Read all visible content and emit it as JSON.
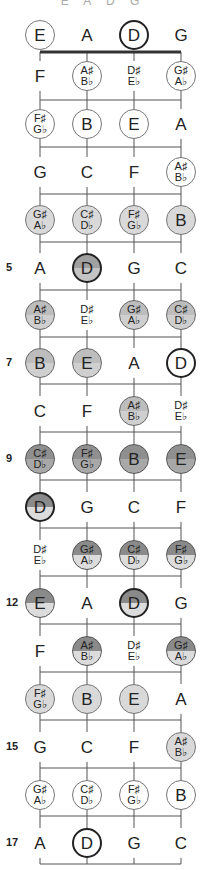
{
  "header": {
    "partial_text": "E A D G"
  },
  "strings": [
    "E",
    "A",
    "D",
    "G"
  ],
  "string_x": [
    40,
    87,
    134,
    181
  ],
  "fret_lines_y": [
    52,
    100,
    147,
    194,
    242,
    290,
    337,
    384,
    432,
    480,
    528,
    576,
    624,
    672,
    720,
    768,
    816,
    864
  ],
  "rows": [
    {
      "fret": "",
      "y": 35,
      "notes": [
        {
          "label": [
            "E"
          ],
          "style": "white"
        },
        {
          "label": [
            "A"
          ],
          "style": "plain"
        },
        {
          "label": [
            "D"
          ],
          "style": "root"
        },
        {
          "label": [
            "G"
          ],
          "style": "plain"
        }
      ]
    },
    {
      "fret": "",
      "y": 76,
      "notes": [
        {
          "label": [
            "F"
          ],
          "style": "plain"
        },
        {
          "label": [
            "A♯",
            "B♭"
          ],
          "style": "white"
        },
        {
          "label": [
            "D♯",
            "E♭"
          ],
          "style": "plain"
        },
        {
          "label": [
            "G♯",
            "A♭"
          ],
          "style": "white"
        }
      ]
    },
    {
      "fret": "",
      "y": 124,
      "notes": [
        {
          "label": [
            "F♯",
            "G♭"
          ],
          "style": "white"
        },
        {
          "label": [
            "B"
          ],
          "style": "white"
        },
        {
          "label": [
            "E"
          ],
          "style": "white"
        },
        {
          "label": [
            "A"
          ],
          "style": "plain"
        }
      ]
    },
    {
      "fret": "",
      "y": 172,
      "notes": [
        {
          "label": [
            "G"
          ],
          "style": "plain"
        },
        {
          "label": [
            "C"
          ],
          "style": "plain"
        },
        {
          "label": [
            "F"
          ],
          "style": "plain"
        },
        {
          "label": [
            "A♯",
            "B♭"
          ],
          "style": "white"
        }
      ]
    },
    {
      "fret": "",
      "y": 220,
      "notes": [
        {
          "label": [
            "G♯",
            "A♭"
          ],
          "style": "light"
        },
        {
          "label": [
            "C♯",
            "D♭"
          ],
          "style": "light"
        },
        {
          "label": [
            "F♯",
            "G♭"
          ],
          "style": "light"
        },
        {
          "label": [
            "B"
          ],
          "style": "light"
        }
      ]
    },
    {
      "fret": "5",
      "y": 268,
      "notes": [
        {
          "label": [
            "A"
          ],
          "style": "plain"
        },
        {
          "label": [
            "D"
          ],
          "style": "rootdark"
        },
        {
          "label": [
            "G"
          ],
          "style": "plain"
        },
        {
          "label": [
            "C"
          ],
          "style": "plain"
        }
      ]
    },
    {
      "fret": "",
      "y": 315,
      "notes": [
        {
          "label": [
            "A♯",
            "B♭"
          ],
          "style": "mid"
        },
        {
          "label": [
            "D♯",
            "E♭"
          ],
          "style": "plain"
        },
        {
          "label": [
            "G♯",
            "A♭"
          ],
          "style": "mid"
        },
        {
          "label": [
            "C♯",
            "D♭"
          ],
          "style": "mid"
        }
      ]
    },
    {
      "fret": "7",
      "y": 363,
      "notes": [
        {
          "label": [
            "B"
          ],
          "style": "mid"
        },
        {
          "label": [
            "E"
          ],
          "style": "mid"
        },
        {
          "label": [
            "A"
          ],
          "style": "plain"
        },
        {
          "label": [
            "D"
          ],
          "style": "root"
        }
      ]
    },
    {
      "fret": "",
      "y": 411,
      "notes": [
        {
          "label": [
            "C"
          ],
          "style": "plain"
        },
        {
          "label": [
            "F"
          ],
          "style": "plain"
        },
        {
          "label": [
            "A♯",
            "B♭"
          ],
          "style": "mid"
        },
        {
          "label": [
            "D♯",
            "E♭"
          ],
          "style": "plain"
        }
      ]
    },
    {
      "fret": "9",
      "y": 459,
      "notes": [
        {
          "label": [
            "C♯",
            "D♭"
          ],
          "style": "dark"
        },
        {
          "label": [
            "F♯",
            "G♭"
          ],
          "style": "dark"
        },
        {
          "label": [
            "B"
          ],
          "style": "dark"
        },
        {
          "label": [
            "E"
          ],
          "style": "dark"
        }
      ]
    },
    {
      "fret": "",
      "y": 507,
      "notes": [
        {
          "label": [
            "D"
          ],
          "style": "rootsplit"
        },
        {
          "label": [
            "G"
          ],
          "style": "plain"
        },
        {
          "label": [
            "C"
          ],
          "style": "plain"
        },
        {
          "label": [
            "F"
          ],
          "style": "plain"
        }
      ]
    },
    {
      "fret": "",
      "y": 555,
      "notes": [
        {
          "label": [
            "D♯",
            "E♭"
          ],
          "style": "plain"
        },
        {
          "label": [
            "G♯",
            "A♭"
          ],
          "style": "split"
        },
        {
          "label": [
            "C♯",
            "D♭"
          ],
          "style": "split"
        },
        {
          "label": [
            "F♯",
            "G♭"
          ],
          "style": "split"
        }
      ]
    },
    {
      "fret": "12",
      "y": 603,
      "notes": [
        {
          "label": [
            "E"
          ],
          "style": "split"
        },
        {
          "label": [
            "A"
          ],
          "style": "plain"
        },
        {
          "label": [
            "D"
          ],
          "style": "rootsplit"
        },
        {
          "label": [
            "G"
          ],
          "style": "plain"
        }
      ]
    },
    {
      "fret": "",
      "y": 651,
      "notes": [
        {
          "label": [
            "F"
          ],
          "style": "plain"
        },
        {
          "label": [
            "A♯",
            "B♭"
          ],
          "style": "split"
        },
        {
          "label": [
            "D♯",
            "E♭"
          ],
          "style": "plain"
        },
        {
          "label": [
            "G♯",
            "A♭"
          ],
          "style": "split"
        }
      ]
    },
    {
      "fret": "",
      "y": 699,
      "notes": [
        {
          "label": [
            "F♯",
            "G♭"
          ],
          "style": "light"
        },
        {
          "label": [
            "B"
          ],
          "style": "light"
        },
        {
          "label": [
            "E"
          ],
          "style": "light"
        },
        {
          "label": [
            "A"
          ],
          "style": "plain"
        }
      ]
    },
    {
      "fret": "15",
      "y": 747,
      "notes": [
        {
          "label": [
            "G"
          ],
          "style": "plain"
        },
        {
          "label": [
            "C"
          ],
          "style": "plain"
        },
        {
          "label": [
            "F"
          ],
          "style": "plain"
        },
        {
          "label": [
            "A♯",
            "B♭"
          ],
          "style": "light"
        }
      ]
    },
    {
      "fret": "",
      "y": 795,
      "notes": [
        {
          "label": [
            "G♯",
            "A♭"
          ],
          "style": "white"
        },
        {
          "label": [
            "C♯",
            "D♭"
          ],
          "style": "white"
        },
        {
          "label": [
            "F♯",
            "G♭"
          ],
          "style": "white"
        },
        {
          "label": [
            "B"
          ],
          "style": "white"
        }
      ]
    },
    {
      "fret": "17",
      "y": 843,
      "notes": [
        {
          "label": [
            "A"
          ],
          "style": "plain"
        },
        {
          "label": [
            "D"
          ],
          "style": "root"
        },
        {
          "label": [
            "G"
          ],
          "style": "plain"
        },
        {
          "label": [
            "C"
          ],
          "style": "plain"
        }
      ]
    }
  ],
  "colors": {
    "line": "#555555",
    "nut": "#333333"
  }
}
